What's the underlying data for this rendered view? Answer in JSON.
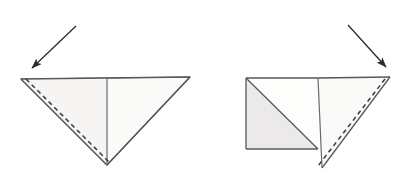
{
  "diagram": {
    "type": "origami-fold-diagram",
    "background_color": "#ffffff",
    "canvas": {
      "width": 413,
      "height": 180
    },
    "line_color": "#58585a",
    "fold_line_color": "#3a3a3c",
    "paper_fill_light": "#fafaf8",
    "paper_fill_shaded": "#ebe9e9",
    "arrow_color": "#2b2b2d",
    "panels": [
      {
        "id": "panel-left",
        "label": "Step 1",
        "description": "Downward-pointing triangle with vertical center crease and dashed valley fold along the left edge",
        "shapes": [
          {
            "name": "left-triangle-body",
            "kind": "polygon",
            "points": "21,79 190,77 107,165",
            "fill": "#fafaf8",
            "stroke": "#58585a"
          },
          {
            "name": "left-inner-panel",
            "kind": "polygon",
            "points": "21,79 107,78 107,165",
            "fill": "#f6f5f3",
            "stroke": "none"
          }
        ],
        "lines": [
          {
            "name": "left-top-edge",
            "x1": 21,
            "y1": 79,
            "x2": 190,
            "y2": 77
          },
          {
            "name": "left-slant-edge",
            "x1": 21,
            "y1": 79,
            "x2": 107,
            "y2": 165
          },
          {
            "name": "left-right-slant-edge",
            "x1": 190,
            "y1": 77,
            "x2": 107,
            "y2": 165
          },
          {
            "name": "left-center-crease",
            "x1": 107,
            "y1": 78,
            "x2": 107,
            "y2": 165
          }
        ],
        "fold_lines": [
          {
            "name": "left-valley-fold-dashed",
            "x1": 26,
            "y1": 79,
            "x2": 110,
            "y2": 163
          }
        ],
        "arrow": {
          "name": "left-fold-arrow",
          "from_x": 76,
          "from_y": 26,
          "to_x": 28,
          "to_y": 72,
          "direction": "down-left"
        }
      },
      {
        "id": "panel-right",
        "label": "Step 2",
        "description": "Square with diagonal crease on the left, plus right triangle flap with dashed valley fold along its hypotenuse",
        "shapes": [
          {
            "name": "right-square-shaded-half",
            "kind": "polygon",
            "points": "246,78 318,149 246,149",
            "fill": "#ebe9e9",
            "stroke": "#58585a"
          },
          {
            "name": "right-square-white-half",
            "kind": "polygon",
            "points": "246,78 318,78 318,149",
            "fill": "#fdfdfc",
            "stroke": "#58585a"
          },
          {
            "name": "right-triangle-flap",
            "kind": "polygon",
            "points": "318,78 390,77 322,168",
            "fill": "#fafaf8",
            "stroke": "#58585a"
          }
        ],
        "lines": [
          {
            "name": "right-square-top-edge",
            "x1": 246,
            "y1": 78,
            "x2": 318,
            "y2": 78
          },
          {
            "name": "right-square-left-edge",
            "x1": 246,
            "y1": 78,
            "x2": 246,
            "y2": 149
          },
          {
            "name": "right-square-bottom-edge",
            "x1": 246,
            "y1": 149,
            "x2": 318,
            "y2": 149
          },
          {
            "name": "right-square-diagonal-crease",
            "x1": 246,
            "y1": 78,
            "x2": 318,
            "y2": 149
          },
          {
            "name": "right-center-crease",
            "x1": 318,
            "y1": 78,
            "x2": 322,
            "y2": 168
          },
          {
            "name": "right-flap-top-edge",
            "x1": 318,
            "y1": 78,
            "x2": 390,
            "y2": 77
          },
          {
            "name": "right-flap-hypotenuse",
            "x1": 390,
            "y1": 77,
            "x2": 322,
            "y2": 168
          }
        ],
        "fold_lines": [
          {
            "name": "right-valley-fold-dashed",
            "x1": 385,
            "y1": 79,
            "x2": 318,
            "y2": 166
          }
        ],
        "arrow": {
          "name": "right-fold-arrow",
          "from_x": 348,
          "from_y": 25,
          "to_x": 390,
          "to_y": 71,
          "direction": "down-right"
        }
      }
    ]
  }
}
